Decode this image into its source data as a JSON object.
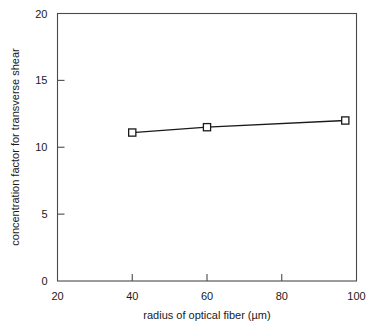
{
  "chart_data": {
    "type": "line",
    "title": "",
    "xlabel": "radius of optical fiber (µm)",
    "ylabel": "concentration factor for transverse shear",
    "xlim": [
      20,
      100
    ],
    "ylim": [
      0,
      20
    ],
    "xticks": [
      20,
      40,
      60,
      80,
      100
    ],
    "xtick_labels": [
      "20",
      "40",
      "60",
      "80",
      "100"
    ],
    "yticks": [
      0,
      5,
      10,
      15,
      20
    ],
    "ytick_labels": [
      "0",
      "5",
      "10",
      "15",
      "20"
    ],
    "grid": false,
    "legend": "none",
    "marker": "open-square",
    "series": [
      {
        "name": "concentration factor",
        "x": [
          40,
          60,
          97
        ],
        "values": [
          11.1,
          11.5,
          12.0
        ]
      }
    ]
  },
  "axes": {
    "x_title": "radius of optical fiber (µm)",
    "y_title": "concentration factor for transverse shear"
  },
  "colors": {
    "frame": "#4a4a4a",
    "line": "#1a1a1a",
    "marker_fill": "#ffffff",
    "background": "#ffffff",
    "text": "#1a1a1a"
  }
}
